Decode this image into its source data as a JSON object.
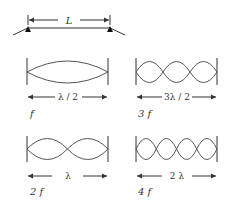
{
  "string": {
    "length_label": "L"
  },
  "modes": [
    {
      "name": "fundamental",
      "loops": 1,
      "length_label": "λ / 2",
      "freq_label": "f"
    },
    {
      "name": "third-harmonic",
      "loops": 3,
      "length_label": "3λ / 2",
      "freq_label": "3 f"
    },
    {
      "name": "second-harmonic",
      "loops": 2,
      "length_label": "λ",
      "freq_label": "2 f"
    },
    {
      "name": "fourth-harmonic",
      "loops": 4,
      "length_label": "2 λ",
      "freq_label": "4 f"
    }
  ],
  "colors": {
    "line": "#333333",
    "wave": "#555555",
    "background": "#ffffff"
  }
}
